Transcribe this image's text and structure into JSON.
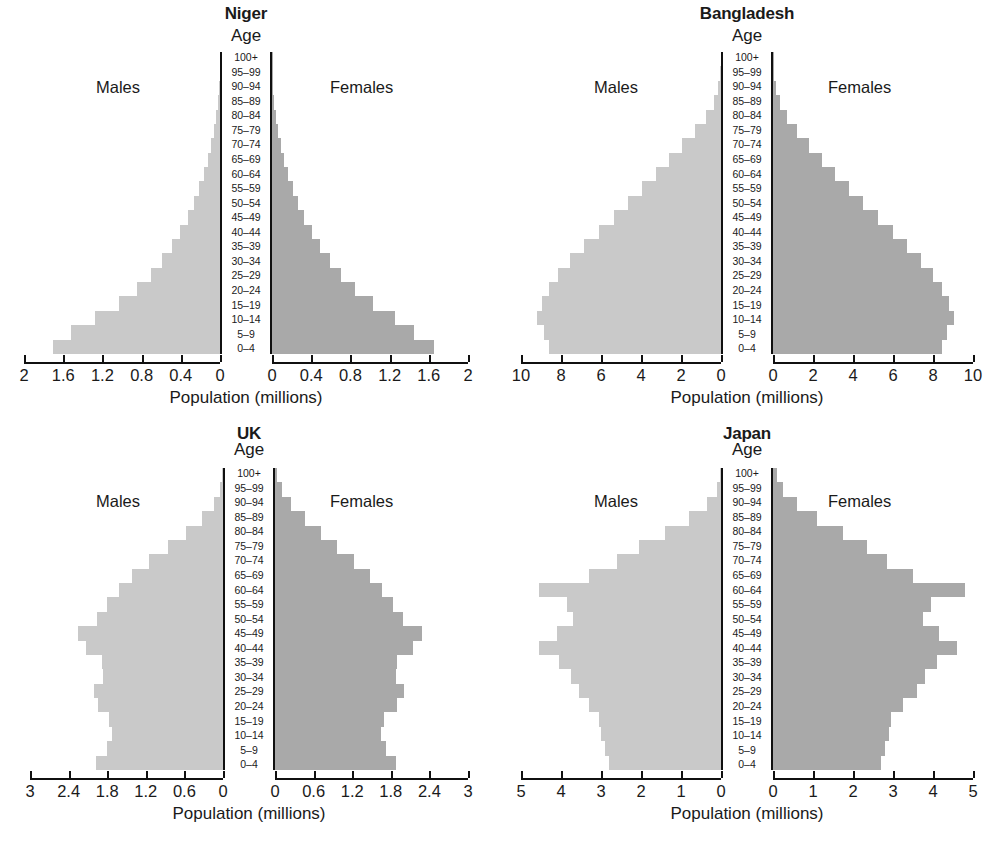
{
  "figure": {
    "xlabel": "Population (millions)",
    "age_header": "Age",
    "males_label": "Males",
    "females_label": "Females",
    "male_color": "#c9c9c9",
    "female_color": "#a9a9a9",
    "axis_color": "#101010",
    "age_groups": [
      "100+",
      "95–99",
      "90–94",
      "85–89",
      "80–84",
      "75–79",
      "70–74",
      "65–69",
      "60–64",
      "55–59",
      "50–54",
      "45–49",
      "40–44",
      "35–39",
      "30–34",
      "25–29",
      "20–24",
      "15–19",
      "10–14",
      "5–9",
      "0–4"
    ]
  },
  "chart_data": [
    {
      "type": "bar",
      "title": "Niger",
      "orientation": "population-pyramid",
      "xlabel": "Population (millions)",
      "ylabel": "Age",
      "xmax": 2,
      "ticks": [
        2,
        1.6,
        1.2,
        0.8,
        0.4,
        0
      ],
      "tick_labels_left": [
        "2",
        "1.6",
        "1.2",
        "0.8",
        "0.4",
        "0"
      ],
      "tick_labels_right": [
        "0",
        "0.4",
        "0.8",
        "1.2",
        "1.6",
        "2"
      ],
      "grid": false,
      "categories": [
        "100+",
        "95–99",
        "90–94",
        "85–89",
        "80–84",
        "75–79",
        "70–74",
        "65–69",
        "60–64",
        "55–59",
        "50–54",
        "45–49",
        "40–44",
        "35–39",
        "30–34",
        "25–29",
        "20–24",
        "15–19",
        "10–14",
        "5–9",
        "0–4"
      ],
      "series": [
        {
          "name": "Males",
          "values": [
            0.002,
            0.005,
            0.012,
            0.022,
            0.038,
            0.06,
            0.088,
            0.122,
            0.162,
            0.21,
            0.265,
            0.33,
            0.405,
            0.49,
            0.59,
            0.705,
            0.845,
            1.03,
            1.28,
            1.52,
            1.7
          ]
        },
        {
          "name": "Females",
          "values": [
            0.002,
            0.005,
            0.012,
            0.022,
            0.038,
            0.06,
            0.088,
            0.122,
            0.162,
            0.21,
            0.265,
            0.33,
            0.405,
            0.49,
            0.59,
            0.705,
            0.845,
            1.03,
            1.26,
            1.45,
            1.65
          ]
        }
      ]
    },
    {
      "type": "bar",
      "title": "Bangladesh",
      "orientation": "population-pyramid",
      "xlabel": "Population (millions)",
      "ylabel": "Age",
      "xmax": 10,
      "ticks": [
        10,
        8,
        6,
        4,
        2,
        0
      ],
      "tick_labels_left": [
        "10",
        "8",
        "6",
        "4",
        "2",
        "0"
      ],
      "tick_labels_right": [
        "0",
        "2",
        "4",
        "6",
        "8",
        "10"
      ],
      "grid": false,
      "categories": [
        "100+",
        "95–99",
        "90–94",
        "85–89",
        "80–84",
        "75–79",
        "70–74",
        "65–69",
        "60–64",
        "55–59",
        "50–54",
        "45–49",
        "40–44",
        "35–39",
        "30–34",
        "25–29",
        "20–24",
        "15–19",
        "10–14",
        "5–9",
        "0–4"
      ],
      "series": [
        {
          "name": "Males",
          "values": [
            0.02,
            0.06,
            0.16,
            0.35,
            0.75,
            1.3,
            1.95,
            2.6,
            3.25,
            3.95,
            4.65,
            5.35,
            6.1,
            6.85,
            7.55,
            8.15,
            8.6,
            8.95,
            9.2,
            8.85,
            8.6
          ]
        },
        {
          "name": "Females",
          "values": [
            0.02,
            0.06,
            0.16,
            0.35,
            0.7,
            1.2,
            1.8,
            2.45,
            3.1,
            3.8,
            4.5,
            5.25,
            6.0,
            6.7,
            7.4,
            8.0,
            8.45,
            8.8,
            9.05,
            8.7,
            8.45
          ]
        }
      ]
    },
    {
      "type": "bar",
      "title": "UK",
      "orientation": "population-pyramid",
      "xlabel": "Population (millions)",
      "ylabel": "Age",
      "xmax": 3,
      "ticks": [
        3,
        2.4,
        1.8,
        1.2,
        0.6,
        0
      ],
      "tick_labels_left": [
        "3",
        "2.4",
        "1.8",
        "1.2",
        "0.6",
        "0"
      ],
      "tick_labels_right": [
        "0",
        "0.6",
        "1.2",
        "1.8",
        "2.4",
        "3"
      ],
      "grid": false,
      "categories": [
        "100+",
        "95–99",
        "90–94",
        "85–89",
        "80–84",
        "75–79",
        "70–74",
        "65–69",
        "60–64",
        "55–59",
        "50–54",
        "45–49",
        "40–44",
        "35–39",
        "30–34",
        "25–29",
        "20–24",
        "15–19",
        "10–14",
        "5–9",
        "0–4"
      ],
      "series": [
        {
          "name": "Males",
          "values": [
            0.01,
            0.05,
            0.14,
            0.33,
            0.58,
            0.86,
            1.15,
            1.42,
            1.62,
            1.8,
            1.96,
            2.26,
            2.13,
            1.88,
            1.87,
            2.0,
            1.95,
            1.77,
            1.72,
            1.8,
            1.98
          ]
        },
        {
          "name": "Females",
          "values": [
            0.035,
            0.11,
            0.25,
            0.47,
            0.72,
            0.96,
            1.23,
            1.48,
            1.67,
            1.83,
            1.99,
            2.29,
            2.15,
            1.89,
            1.88,
            2.01,
            1.9,
            1.7,
            1.65,
            1.72,
            1.88
          ]
        }
      ]
    },
    {
      "type": "bar",
      "title": "Japan",
      "orientation": "population-pyramid",
      "xlabel": "Population (millions)",
      "ylabel": "Age",
      "xmax": 5,
      "ticks": [
        5,
        4,
        3,
        2,
        1,
        0
      ],
      "tick_labels_left": [
        "5",
        "4",
        "3",
        "2",
        "1",
        "0"
      ],
      "tick_labels_right": [
        "0",
        "1",
        "2",
        "3",
        "4",
        "5"
      ],
      "grid": false,
      "categories": [
        "100+",
        "95–99",
        "90–94",
        "85–89",
        "80–84",
        "75–79",
        "70–74",
        "65–69",
        "60–64",
        "55–59",
        "50–54",
        "45–49",
        "40–44",
        "35–39",
        "30–34",
        "25–29",
        "20–24",
        "15–19",
        "10–14",
        "5–9",
        "0–4"
      ],
      "series": [
        {
          "name": "Males",
          "values": [
            0.02,
            0.1,
            0.35,
            0.8,
            1.4,
            2.05,
            2.6,
            3.3,
            4.55,
            3.85,
            3.7,
            4.1,
            4.55,
            4.05,
            3.75,
            3.55,
            3.3,
            3.05,
            3.0,
            2.9,
            2.8
          ]
        },
        {
          "name": "Females",
          "values": [
            0.1,
            0.25,
            0.6,
            1.1,
            1.75,
            2.35,
            2.85,
            3.5,
            4.8,
            3.95,
            3.75,
            4.15,
            4.6,
            4.1,
            3.8,
            3.6,
            3.25,
            2.95,
            2.9,
            2.8,
            2.7
          ]
        }
      ]
    }
  ]
}
